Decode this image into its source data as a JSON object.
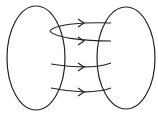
{
  "diagram": {
    "type": "mapping",
    "sets": [
      {
        "name": "left-set",
        "cx": 36,
        "cy": 58,
        "rx": 29,
        "ry": 52
      },
      {
        "name": "right-set",
        "cx": 126,
        "cy": 58,
        "rx": 29,
        "ry": 51
      }
    ],
    "arrows": [
      {
        "name": "loop-arrow-top",
        "path": "M111,23 C85,22 55,24 50,31 C55,38 85,41 111,41",
        "heads": [
          [
            82,
            23
          ],
          [
            82,
            41
          ]
        ]
      },
      {
        "name": "arrow-middle",
        "path": "M51,64 C70,67 95,69 111,63",
        "heads": [
          [
            83,
            67
          ]
        ]
      },
      {
        "name": "arrow-bottom",
        "path": "M51,88 C70,92 95,94 111,88",
        "heads": [
          [
            83,
            92
          ]
        ]
      }
    ],
    "stroke_color": "#222222"
  }
}
